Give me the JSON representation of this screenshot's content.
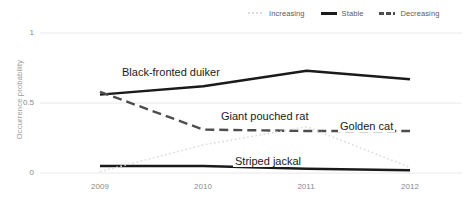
{
  "legend": {
    "position": "top-right",
    "items": [
      {
        "label": "Increasing",
        "style": "dotted",
        "color": "#dcdcdc",
        "icon": "line-dotted-icon"
      },
      {
        "label": "Stable",
        "style": "solid",
        "color": "#1a1a1a",
        "icon": "line-solid-icon"
      },
      {
        "label": "Decreasing",
        "style": "dashed",
        "color": "#4d4d4d",
        "icon": "line-dashed-icon"
      }
    ]
  },
  "axes": {
    "y_ticks": [
      "0",
      "0.5",
      "1"
    ],
    "y_tick_1": "1",
    "y_tick_05": "0.5",
    "y_tick_0": "0",
    "y_title": "Occurrence probability",
    "x_ticks": [
      "2009",
      "2010",
      "2011",
      "2012"
    ],
    "x_2009": "2009",
    "x_2010": "2010",
    "x_2011": "2011",
    "x_2012": "2012"
  },
  "annotations": {
    "duiker": "Black-fronted duiker",
    "pouched_rat": "Giant pouched rat",
    "golden_cat": "Golden cat",
    "striped_jackal": "Striped jackal"
  },
  "chart_data": {
    "type": "line",
    "title": "",
    "xlabel": "",
    "ylabel": "Occurrence probability",
    "x": [
      2009,
      2010,
      2011,
      2012
    ],
    "categories": [
      "2009",
      "2010",
      "2011",
      "2012"
    ],
    "ylim": [
      0,
      1
    ],
    "yticks": [
      0,
      0.5,
      1
    ],
    "grid": true,
    "grid_axis": "y",
    "legend_position": "top-right",
    "series": [
      {
        "name": "Black-fronted duiker",
        "trend": "Stable",
        "style": "solid",
        "color": "#1a1a1a",
        "values": [
          0.56,
          0.62,
          0.73,
          0.67
        ]
      },
      {
        "name": "Giant pouched rat",
        "trend": "Decreasing",
        "style": "dashed",
        "color": "#4d4d4d",
        "values": [
          0.58,
          0.31,
          0.3,
          0.3
        ]
      },
      {
        "name": "Golden cat",
        "trend": "Decreasing",
        "style": "dashed",
        "color": "#4d4d4d",
        "values": [
          0.58,
          0.31,
          0.3,
          0.3
        ]
      },
      {
        "name": "Striped jackal",
        "trend": "Stable",
        "style": "solid",
        "color": "#1a1a1a",
        "values": [
          0.05,
          0.05,
          0.03,
          0.02
        ]
      },
      {
        "name": "Increasing",
        "trend": "Increasing",
        "style": "dotted",
        "color": "#dcdcdc",
        "values": [
          0.01,
          0.2,
          0.33,
          0.04
        ]
      }
    ]
  }
}
